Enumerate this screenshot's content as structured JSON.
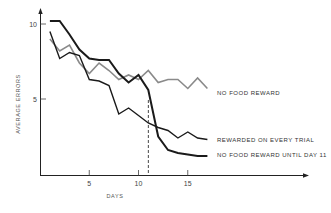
{
  "chart_data": {
    "type": "line",
    "title": "",
    "xlabel": "DAYS",
    "ylabel": "AVERAGE ERRORS",
    "xlim": [
      0,
      27
    ],
    "ylim": [
      0,
      10.5
    ],
    "x_ticks": [
      5,
      10,
      15
    ],
    "y_ticks": [
      5,
      10
    ],
    "grid": false,
    "legend_position": "inline-right",
    "x": [
      1,
      2,
      3,
      4,
      5,
      6,
      7,
      8,
      9,
      10,
      11,
      12,
      13,
      14,
      15,
      16,
      17
    ],
    "series": [
      {
        "name": "NO FOOD REWARD",
        "color": "#8a8a8a",
        "stroke_width": 1.6,
        "values": [
          9.0,
          8.2,
          8.6,
          7.4,
          6.7,
          7.4,
          6.9,
          6.3,
          6.6,
          6.3,
          6.9,
          6.1,
          6.3,
          6.3,
          5.7,
          6.4,
          5.7
        ]
      },
      {
        "name": "REWARDED ON EVERY TRIAL",
        "color": "#1a1a1a",
        "stroke_width": 1.4,
        "values": [
          9.5,
          7.7,
          8.1,
          7.9,
          6.3,
          6.2,
          5.9,
          4.0,
          4.4,
          3.9,
          3.4,
          3.1,
          2.9,
          2.4,
          2.8,
          2.4,
          2.3
        ]
      },
      {
        "name": "NO FOOD REWARD UNTIL DAY 11",
        "color": "#1a1a1a",
        "stroke_width": 2.0,
        "values": [
          10.2,
          10.2,
          9.3,
          8.3,
          7.7,
          7.6,
          7.6,
          6.7,
          6.1,
          6.6,
          5.6,
          2.5,
          1.6,
          1.4,
          1.3,
          1.2,
          1.2
        ]
      }
    ],
    "annotations": [
      {
        "type": "vertical-dashed-line",
        "x": 11,
        "label": ""
      }
    ]
  }
}
